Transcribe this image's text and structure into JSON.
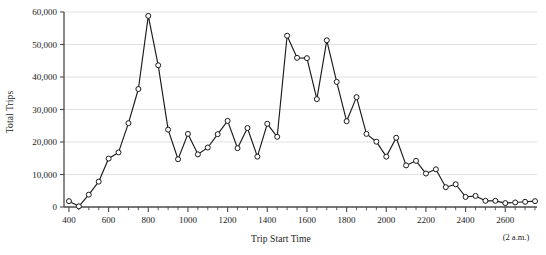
{
  "chart_data": {
    "type": "line",
    "title": "",
    "subtitle": "",
    "xlabel": "Trip Start Time",
    "ylabel": "Total Trips",
    "xlim": [
      375,
      2760
    ],
    "ylim": [
      0,
      60000
    ],
    "grid": "horizontal",
    "legend": "none",
    "marker": "open-circle",
    "line_color": "#1a1a1a",
    "marker_fill": "#ffffff",
    "grid_color": "#d9d9d9",
    "axis_color": "#4a4a4a",
    "annotations": [
      {
        "text": "(2 a.m.)",
        "x": 2600,
        "y": -12000
      }
    ],
    "x_ticks": [
      400,
      600,
      800,
      1000,
      1200,
      1400,
      1600,
      1800,
      2000,
      2200,
      2400,
      2600
    ],
    "x_tick_labels": [
      "400",
      "600",
      "800",
      "1000",
      "1200",
      "1400",
      "1600",
      "1800",
      "2000",
      "2200",
      "2400",
      "2600"
    ],
    "x_minor_step": 50,
    "y_ticks": [
      0,
      10000,
      20000,
      30000,
      40000,
      50000,
      60000
    ],
    "y_tick_labels": [
      "0",
      "10,000",
      "20,000",
      "30,000",
      "40,000",
      "50,000",
      "60,000"
    ],
    "x": [
      400,
      450,
      500,
      550,
      600,
      650,
      700,
      750,
      800,
      850,
      900,
      950,
      1000,
      1050,
      1100,
      1150,
      1200,
      1250,
      1300,
      1350,
      1400,
      1450,
      1500,
      1550,
      1600,
      1650,
      1700,
      1750,
      1800,
      1850,
      1900,
      1950,
      2000,
      2050,
      2100,
      2150,
      2200,
      2250,
      2300,
      2350,
      2400,
      2450,
      2500,
      2550,
      2600,
      2650,
      2700,
      2750
    ],
    "values": [
      1800,
      200,
      3800,
      7800,
      14900,
      16800,
      25800,
      36300,
      58800,
      43600,
      23800,
      14700,
      22500,
      16200,
      18300,
      22400,
      26500,
      18100,
      24300,
      15500,
      25600,
      21600,
      52700,
      45900,
      45800,
      33200,
      51300,
      38500,
      26400,
      33800,
      22500,
      20100,
      15500,
      21300,
      12800,
      14200,
      10300,
      11600,
      6100,
      7000,
      3100,
      3400,
      1900,
      1900,
      1200,
      1400,
      1600,
      1800
    ]
  },
  "axis": {
    "ylabel": "Total Trips",
    "xlabel": "Trip Start Time",
    "note": "(2 a.m.)"
  }
}
